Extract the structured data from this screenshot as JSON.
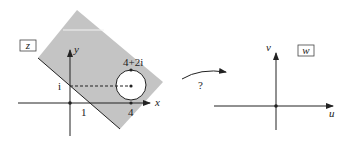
{
  "colors": {
    "background": "#ffffff",
    "region_fill": "#c4c4c4",
    "ink": "#222222",
    "circle_fill": "#ffffff"
  },
  "z_plane": {
    "plane_label": "z",
    "x_axis_label": "x",
    "y_axis_label": "y",
    "origin_label": "",
    "tick_x_1": "1",
    "tick_y_i": "i",
    "tick_x_4": "4",
    "circle_point_label": "4+2i",
    "region": {
      "description": "shaded strip region above line through i and 1 (half-plane truncated)",
      "polygon_px": [
        [
          38,
          58
        ],
        [
          77,
          10
        ],
        [
          163,
          82
        ],
        [
          120,
          129
        ]
      ]
    },
    "circle": {
      "center": "4+i",
      "radius": 1,
      "center_px": [
        131,
        85
      ],
      "radius_px": 15
    },
    "dashed_line": {
      "from": "i",
      "to": "4+i"
    }
  },
  "mapping": {
    "arrow_label": "?"
  },
  "w_plane": {
    "plane_label": "w",
    "u_axis_label": "u",
    "v_axis_label": "v"
  }
}
